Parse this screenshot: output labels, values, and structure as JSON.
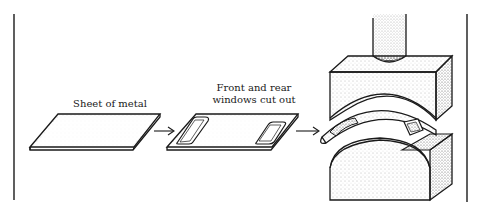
{
  "diagram": {
    "type": "process-flow",
    "steps": [
      {
        "id": "sheet",
        "label": "Sheet of metal"
      },
      {
        "id": "windows",
        "label_line1": "Front and rear",
        "label_line2": "windows cut out"
      },
      {
        "id": "press",
        "label": ""
      }
    ],
    "arrows": [
      {
        "from": "sheet",
        "to": "windows"
      },
      {
        "from": "windows",
        "to": "press"
      }
    ],
    "colors": {
      "ink": "#1a1a1a",
      "background": "#ffffff",
      "stipple": "#555555"
    }
  }
}
